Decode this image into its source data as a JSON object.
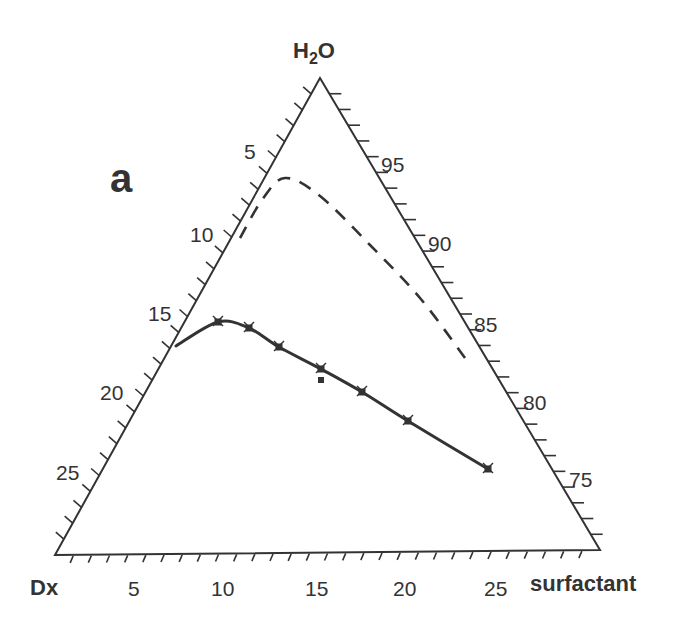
{
  "figure": {
    "panel_label": "a",
    "apex_labels": {
      "top": "H",
      "top_sub": "2",
      "top_suffix": "O",
      "bottom_left": "Dx",
      "bottom_right": "surfactant"
    },
    "left_axis_ticks": [
      "5",
      "10",
      "15",
      "20",
      "25"
    ],
    "right_axis_ticks": [
      "95",
      "90",
      "85",
      "80",
      "75"
    ],
    "bottom_axis_ticks": [
      "5",
      "10",
      "15",
      "20",
      "25"
    ]
  },
  "chart_data": {
    "type": "ternary",
    "title": "a",
    "components": [
      "H2O",
      "Dx",
      "surfactant"
    ],
    "axes": {
      "H2O": {
        "ticks": [
          75,
          80,
          85,
          90,
          95
        ],
        "side": "right"
      },
      "Dx": {
        "ticks": [
          5,
          10,
          15,
          20,
          25
        ],
        "side": "left"
      },
      "surfactant": {
        "ticks": [
          5,
          10,
          15,
          20,
          25
        ],
        "side": "bottom"
      }
    },
    "series": [
      {
        "name": "solid phase boundary (measured)",
        "style": "solid",
        "markers": "x",
        "points_pixel": [
          [
            176,
            346
          ],
          [
            218,
            322
          ],
          [
            249,
            328
          ],
          [
            279,
            347
          ],
          [
            321,
            369
          ],
          [
            362,
            392
          ],
          [
            408,
            421
          ],
          [
            488,
            469
          ]
        ]
      },
      {
        "name": "dashed boundary",
        "style": "dashed",
        "points_pixel": [
          [
            240,
            238
          ],
          [
            262,
            200
          ],
          [
            285,
            178
          ],
          [
            320,
            196
          ],
          [
            370,
            245
          ],
          [
            420,
            298
          ],
          [
            465,
            358
          ]
        ]
      },
      {
        "name": "isolated point",
        "style": "marker",
        "points_pixel": [
          [
            321,
            380
          ]
        ]
      }
    ]
  },
  "geometry": {
    "apex": [
      320,
      78
    ],
    "bottom_left": [
      55,
      555
    ],
    "bottom_right": [
      600,
      550
    ],
    "ink": "#333333"
  }
}
